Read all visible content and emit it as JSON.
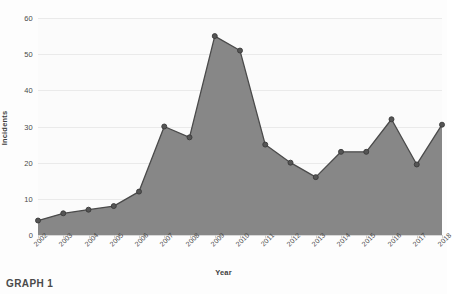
{
  "caption": "GRAPH 1",
  "chart_data": {
    "type": "area",
    "title": "",
    "xlabel": "Year",
    "ylabel": "Incidents",
    "categories": [
      "2002",
      "2003",
      "2004",
      "2005",
      "2006",
      "2007",
      "2008",
      "2009",
      "2010",
      "2011",
      "2012",
      "2013",
      "2014",
      "2015",
      "2016",
      "2017",
      "2018"
    ],
    "values": [
      4,
      6,
      7,
      8,
      12,
      30,
      27,
      55,
      51,
      25,
      20,
      16,
      23,
      23,
      32,
      19.5,
      30.5
    ],
    "series": [
      {
        "name": "Incidents",
        "values": [
          4,
          6,
          7,
          8,
          12,
          30,
          27,
          55,
          51,
          25,
          20,
          16,
          23,
          23,
          32,
          19.5,
          30.5
        ]
      }
    ],
    "ylim": [
      0,
      60
    ],
    "yticks": [
      0,
      10,
      20,
      30,
      40,
      50,
      60
    ],
    "ytick_labels": [
      "0",
      "10",
      "20",
      "30",
      "40",
      "50",
      "60"
    ],
    "grid": true,
    "legend": "none",
    "xtick_rotation": -45,
    "colors": {
      "area_fill": "#878787",
      "line": "#4a4a4a",
      "marker": "#555555",
      "marker_edge": "#3a3a3a",
      "gridline": "#eaeaea",
      "baseline": "#d8d8d8",
      "plot_background": "#fbfbfb",
      "figure_background": "#fdfdfd",
      "text": "#4a4a4a"
    }
  }
}
